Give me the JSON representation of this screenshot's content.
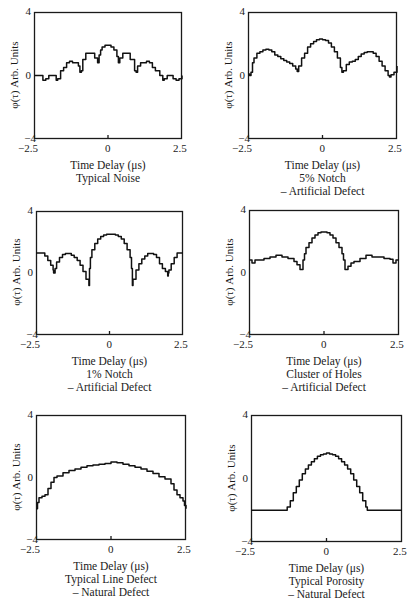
{
  "figure": {
    "ylabel": "φ(τ) Arb. Units",
    "xlabel": "Time Delay (μs)",
    "xticks": [
      "−2.5",
      "0",
      "2.5"
    ],
    "yticks": [
      "4",
      "0",
      "−4"
    ]
  },
  "panels": [
    {
      "id": "p1",
      "title": "Typical Noise",
      "subtitle": ""
    },
    {
      "id": "p2",
      "title": "5% Notch",
      "subtitle": "– Artificial Defect"
    },
    {
      "id": "p3",
      "title": "1% Notch",
      "subtitle": "– Artificial Defect"
    },
    {
      "id": "p4",
      "title": "Cluster of Holes",
      "subtitle": "– Artificial Defect"
    },
    {
      "id": "p5",
      "title": "Typical Line Defect",
      "subtitle": "– Natural Defect"
    },
    {
      "id": "p6",
      "title": "Typical Porosity",
      "subtitle": "– Natural Defect"
    }
  ],
  "chart_data": [
    {
      "type": "line",
      "title": "Typical Noise",
      "xlabel": "Time Delay (μs)",
      "ylabel": "φ(τ) Arb. Units",
      "xlim": [
        -2.5,
        2.5
      ],
      "ylim": [
        -4,
        4
      ],
      "x": [
        -2.5,
        -2.3,
        -2.2,
        -2.1,
        -2.0,
        -1.85,
        -1.75,
        -1.7,
        -1.6,
        -1.5,
        -1.4,
        -1.3,
        -1.2,
        -1.0,
        -0.95,
        -0.9,
        -0.85,
        -0.75,
        -0.6,
        -0.45,
        -0.35,
        -0.3,
        -0.25,
        -0.2,
        -0.1,
        0.0,
        0.1,
        0.2,
        0.3,
        0.35,
        0.4,
        0.5,
        0.6,
        0.75,
        0.9,
        0.95,
        1.0,
        1.1,
        1.3,
        1.4,
        1.5,
        1.6,
        1.75,
        1.85,
        1.9,
        2.0,
        2.1,
        2.2,
        2.3,
        2.4,
        2.5
      ],
      "y": [
        0,
        0,
        -0.3,
        -0.2,
        0,
        0,
        -0.3,
        -0.2,
        0.3,
        0.5,
        0.8,
        0.9,
        0.8,
        0.6,
        0.2,
        0.3,
        1.0,
        1.4,
        1.4,
        1.1,
        0.8,
        1.3,
        1.6,
        1.8,
        1.9,
        1.9,
        1.8,
        1.6,
        1.2,
        0.8,
        1.1,
        1.4,
        1.4,
        1.0,
        0.3,
        0.2,
        0.6,
        0.8,
        0.9,
        0.8,
        0.5,
        0.3,
        0,
        -0.3,
        -0.2,
        0,
        0,
        -0.2,
        -0.3,
        -0.2,
        0
      ]
    },
    {
      "type": "line",
      "title": "5% Notch – Artificial Defect",
      "xlabel": "Time Delay (μs)",
      "ylabel": "φ(τ) Arb. Units",
      "xlim": [
        -2.5,
        2.5
      ],
      "ylim": [
        -4,
        4
      ],
      "x": [
        -2.5,
        -2.45,
        -2.4,
        -2.35,
        -2.3,
        -2.2,
        -2.1,
        -2.0,
        -1.9,
        -1.8,
        -1.7,
        -1.6,
        -1.5,
        -1.4,
        -1.3,
        -1.2,
        -1.1,
        -1.0,
        -0.9,
        -0.85,
        -0.8,
        -0.7,
        -0.6,
        -0.5,
        -0.4,
        -0.3,
        -0.2,
        -0.1,
        0.0,
        0.1,
        0.2,
        0.3,
        0.4,
        0.5,
        0.6,
        0.65,
        0.7,
        0.8,
        0.9,
        1.0,
        1.1,
        1.2,
        1.3,
        1.4,
        1.5,
        1.6,
        1.7,
        1.8,
        1.9,
        2.0,
        2.1,
        2.2,
        2.25,
        2.3,
        2.4,
        2.5
      ],
      "y": [
        0.1,
        0.0,
        0.2,
        0.8,
        1.1,
        1.4,
        1.5,
        1.6,
        1.65,
        1.6,
        1.5,
        1.3,
        1.2,
        1.05,
        0.95,
        0.85,
        0.75,
        0.6,
        0.4,
        0.25,
        0.6,
        1.1,
        1.4,
        1.8,
        2.0,
        2.15,
        2.25,
        2.3,
        2.25,
        2.2,
        2.05,
        1.8,
        1.5,
        1.1,
        0.5,
        0.2,
        0.3,
        0.7,
        0.85,
        0.9,
        1.0,
        1.2,
        1.35,
        1.45,
        1.5,
        1.5,
        1.4,
        1.2,
        0.9,
        0.6,
        0.3,
        0.0,
        -0.1,
        0.05,
        0.2,
        0.6
      ]
    },
    {
      "type": "line",
      "title": "1% Notch – Artificial Defect",
      "xlabel": "Time Delay (μs)",
      "ylabel": "φ(τ) Arb. Units",
      "xlim": [
        -2.5,
        2.5
      ],
      "ylim": [
        -4,
        4
      ],
      "x": [
        -2.5,
        -2.3,
        -2.2,
        -2.1,
        -2.0,
        -1.92,
        -1.9,
        -1.85,
        -1.8,
        -1.7,
        -1.6,
        -1.5,
        -1.4,
        -1.3,
        -1.2,
        -1.1,
        -1.0,
        -0.9,
        -0.8,
        -0.7,
        -0.68,
        -0.65,
        -0.6,
        -0.5,
        -0.4,
        -0.3,
        -0.2,
        -0.1,
        0.0,
        0.1,
        0.2,
        0.3,
        0.4,
        0.5,
        0.6,
        0.7,
        0.75,
        0.78,
        0.8,
        0.9,
        1.0,
        1.1,
        1.2,
        1.3,
        1.4,
        1.5,
        1.6,
        1.7,
        1.8,
        1.9,
        1.98,
        2.0,
        2.02,
        2.1,
        2.2,
        2.3,
        2.5
      ],
      "y": [
        1.3,
        1.3,
        1.1,
        0.8,
        0.5,
        0.2,
        0.0,
        0.3,
        0.7,
        1.0,
        1.2,
        1.25,
        1.25,
        1.15,
        1.0,
        0.8,
        0.5,
        0.1,
        -0.4,
        -0.8,
        0.3,
        1.0,
        1.5,
        1.9,
        2.2,
        2.35,
        2.45,
        2.5,
        2.5,
        2.5,
        2.45,
        2.35,
        2.2,
        1.9,
        1.5,
        1.0,
        0.3,
        -0.8,
        -0.4,
        0.2,
        0.6,
        0.9,
        1.1,
        1.25,
        1.25,
        1.2,
        1.0,
        0.6,
        0.3,
        0.1,
        -0.2,
        0.0,
        0.2,
        0.6,
        1.0,
        1.3,
        1.3
      ]
    },
    {
      "type": "line",
      "title": "Cluster of Holes – Artificial Defect",
      "xlabel": "Time Delay (μs)",
      "ylabel": "φ(τ) Arb. Units",
      "xlim": [
        -2.5,
        2.5
      ],
      "ylim": [
        -4,
        4
      ],
      "x": [
        -2.5,
        -2.4,
        -2.3,
        -2.2,
        -2.0,
        -1.8,
        -1.6,
        -1.4,
        -1.2,
        -1.0,
        -0.9,
        -0.8,
        -0.75,
        -0.7,
        -0.65,
        -0.6,
        -0.5,
        -0.4,
        -0.3,
        -0.2,
        -0.1,
        0.0,
        0.1,
        0.2,
        0.3,
        0.4,
        0.5,
        0.6,
        0.65,
        0.7,
        0.75,
        0.8,
        0.9,
        1.0,
        1.2,
        1.4,
        1.6,
        1.8,
        2.0,
        2.2,
        2.3,
        2.4,
        2.5
      ],
      "y": [
        0.8,
        0.6,
        0.8,
        0.8,
        0.9,
        1.0,
        1.1,
        1.0,
        0.9,
        0.7,
        0.5,
        0.2,
        0.2,
        0.8,
        1.2,
        1.6,
        1.9,
        2.2,
        2.4,
        2.55,
        2.6,
        2.6,
        2.55,
        2.4,
        2.2,
        1.9,
        1.6,
        1.2,
        0.8,
        0.2,
        0.2,
        0.4,
        0.6,
        0.7,
        0.9,
        1.1,
        1.0,
        1.0,
        0.9,
        0.85,
        0.6,
        0.8,
        0.8
      ]
    },
    {
      "type": "line",
      "title": "Typical Line Defect – Natural Defect",
      "xlabel": "Time Delay (μs)",
      "ylabel": "φ(τ) Arb. Units",
      "xlim": [
        -2.5,
        2.5
      ],
      "ylim": [
        -4,
        4
      ],
      "x": [
        -2.5,
        -2.45,
        -2.4,
        -2.3,
        -2.2,
        -2.1,
        -2.0,
        -1.9,
        -1.8,
        -1.6,
        -1.4,
        -1.2,
        -1.0,
        -0.8,
        -0.6,
        -0.4,
        -0.2,
        0.0,
        0.1,
        0.2,
        0.4,
        0.6,
        0.8,
        1.0,
        1.2,
        1.4,
        1.6,
        1.8,
        2.0,
        2.1,
        2.2,
        2.3,
        2.4,
        2.45,
        2.5
      ],
      "y": [
        -2.0,
        -1.6,
        -1.3,
        -1.2,
        -1.1,
        -0.7,
        -0.3,
        0.0,
        0.1,
        0.3,
        0.45,
        0.55,
        0.65,
        0.75,
        0.8,
        0.85,
        0.9,
        1.0,
        1.0,
        0.95,
        0.85,
        0.75,
        0.65,
        0.55,
        0.4,
        0.25,
        0.05,
        -0.1,
        -0.4,
        -0.8,
        -1.1,
        -1.3,
        -1.5,
        -1.8,
        -2.0
      ]
    },
    {
      "type": "line",
      "title": "Typical Porosity – Natural Defect",
      "xlabel": "Time Delay (μs)",
      "ylabel": "φ(τ) Arb. Units",
      "xlim": [
        -2.5,
        2.5
      ],
      "ylim": [
        -4,
        4
      ],
      "x": [
        -2.5,
        -1.35,
        -1.3,
        -1.2,
        -1.1,
        -1.0,
        -0.9,
        -0.8,
        -0.7,
        -0.6,
        -0.5,
        -0.4,
        -0.3,
        -0.2,
        -0.1,
        0.0,
        0.1,
        0.2,
        0.3,
        0.4,
        0.5,
        0.6,
        0.7,
        0.8,
        0.9,
        1.0,
        1.1,
        1.2,
        1.3,
        1.35,
        2.5
      ],
      "y": [
        -2.0,
        -2.0,
        -1.8,
        -1.4,
        -0.9,
        -0.5,
        -0.1,
        0.3,
        0.6,
        0.85,
        1.05,
        1.25,
        1.4,
        1.5,
        1.55,
        1.6,
        1.55,
        1.5,
        1.4,
        1.25,
        1.05,
        0.85,
        0.6,
        0.3,
        -0.1,
        -0.5,
        -0.9,
        -1.4,
        -1.8,
        -2.0,
        -2.0
      ]
    }
  ]
}
